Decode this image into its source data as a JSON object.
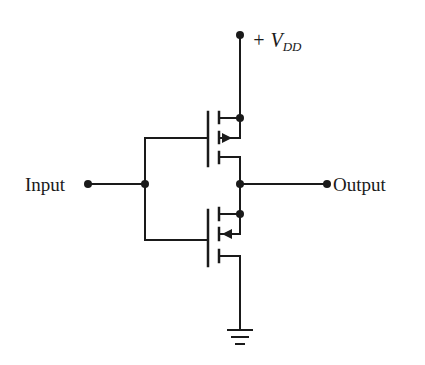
{
  "diagram": {
    "type": "CMOS inverter schematic",
    "labels": {
      "supply": "+ V",
      "supply_sub": "DD",
      "input": "Input",
      "output": "Output"
    },
    "components": [
      {
        "name": "PMOS transistor",
        "position": "top",
        "source": "+VDD",
        "drain": "Output"
      },
      {
        "name": "NMOS transistor",
        "position": "bottom",
        "source": "Ground",
        "drain": "Output"
      }
    ],
    "nodes": [
      "+VDD",
      "Input",
      "Output",
      "Ground"
    ],
    "colors": {
      "line": "#1a1a1a",
      "background": "#ffffff"
    }
  }
}
